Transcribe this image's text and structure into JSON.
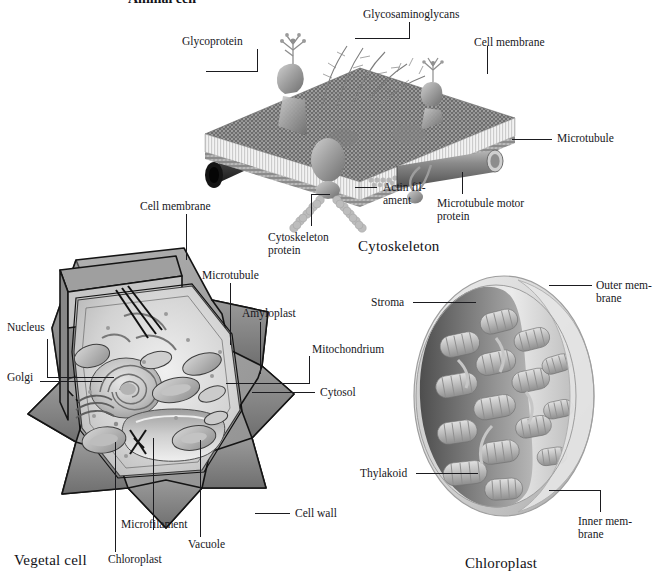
{
  "figure": {
    "background": "#ffffff",
    "ink": "#1b1b1f",
    "title": "Animal cell"
  },
  "panels": {
    "cytoskeleton": {
      "caption": "Cytoskeleton",
      "labels": {
        "glycoprotein": "Glycoprotein",
        "glycosaminoglycans": "Glycosaminoglycans",
        "cell_membrane": "Cell membrane",
        "microtubule": "Microtubule",
        "microtubule_motor_protein": "Microtubule motor\nprotein",
        "actin_filament": "Actin fil-\nament",
        "cytoskeleton_protein": "Cytoskeleton\nprotein"
      }
    },
    "vegetal_cell": {
      "caption": "Vegetal cell",
      "labels": {
        "cell_membrane": "Cell membrane",
        "microtubule": "Microtubule",
        "amyloplast": "Amyloplast",
        "mitochondrium": "Mitochondrium",
        "cytosol": "Cytosol",
        "nucleus": "Nucleus",
        "golgi": "Golgi",
        "cell_wall": "Cell wall",
        "vacuole": "Vacuole",
        "microfilament": "Microfilament",
        "chloroplast": "Chloroplast"
      }
    },
    "chloroplast": {
      "caption": "Chloroplast",
      "labels": {
        "stroma": "Stroma",
        "outer_membrane": "Outer mem-\nbrane",
        "inner_membrane": "Inner mem-\nbrane",
        "thylakoid": "Thylakoid"
      }
    }
  },
  "colors": {
    "membrane_dark": "#6f6f6f",
    "membrane_light": "#e8e8e8",
    "protein_gray": "#9a9a9a",
    "wall_gray": "#8e8e8e",
    "cytosol_gray": "#c9c9c9",
    "chloroplast_gray": "#c2c2c2",
    "stroma_dark": "#5d5d5d"
  }
}
